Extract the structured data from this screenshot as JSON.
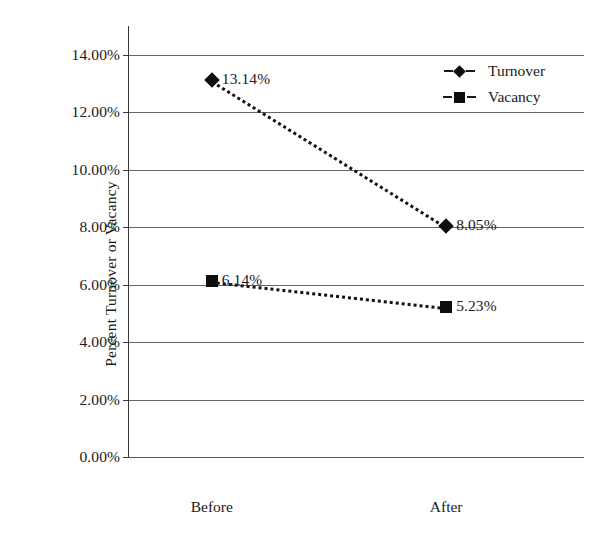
{
  "chart_data": {
    "type": "line",
    "title": "",
    "xlabel": "",
    "ylabel": "Percent Turnover or Vacancy",
    "categories": [
      "Before",
      "After"
    ],
    "ylim": [
      0,
      14
    ],
    "ytick_labels": [
      "0.00%",
      "2.00%",
      "4.00%",
      "6.00%",
      "8.00%",
      "10.00%",
      "12.00%",
      "14.00%"
    ],
    "ytick_values": [
      0,
      2,
      4,
      6,
      8,
      10,
      12,
      14
    ],
    "grid": true,
    "legend_position": "top-right",
    "series": [
      {
        "name": "Turnover",
        "marker": "diamond",
        "linestyle": "dotted",
        "values": [
          13.14,
          8.05
        ],
        "point_labels": [
          "13.14%",
          "8.05%"
        ]
      },
      {
        "name": "Vacancy",
        "marker": "square",
        "linestyle": "dotted",
        "values": [
          6.14,
          5.23
        ],
        "point_labels": [
          "6.14%",
          "5.23%"
        ]
      }
    ]
  },
  "colors": {
    "marker": "#0d0d0d",
    "gridline": "#4a4a4a",
    "axis": "#3a3a3a",
    "text": "#1a1a1a",
    "background": "#ffffff"
  }
}
